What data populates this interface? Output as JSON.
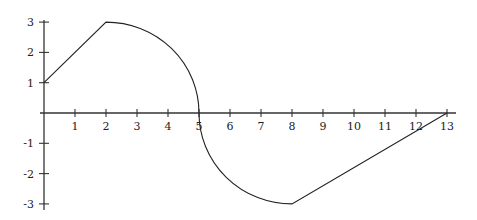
{
  "chart_data": {
    "type": "line",
    "title": "",
    "xlabel": "",
    "ylabel": "",
    "xlim": [
      0,
      13
    ],
    "ylim": [
      -3,
      3
    ],
    "grid": false,
    "legend": null,
    "x_ticks": [
      "1",
      "2",
      "3",
      "4",
      "5",
      "6",
      "7",
      "8",
      "9",
      "10",
      "11",
      "12",
      "13"
    ],
    "y_ticks": [
      "3",
      "2",
      "1",
      "-1",
      "-2",
      "-3"
    ],
    "segments": [
      {
        "kind": "line",
        "from": [
          0,
          1
        ],
        "to": [
          2,
          3
        ]
      },
      {
        "kind": "quarter-circle",
        "center": [
          2,
          0
        ],
        "radius": 3,
        "from": [
          2,
          3
        ],
        "to": [
          5,
          0
        ]
      },
      {
        "kind": "quarter-circle",
        "center": [
          8,
          0
        ],
        "radius": 3,
        "from": [
          5,
          0
        ],
        "to": [
          8,
          -3
        ]
      },
      {
        "kind": "line",
        "from": [
          8,
          -3
        ],
        "to": [
          13,
          0
        ]
      }
    ],
    "x": [
      0,
      2,
      3,
      4,
      5,
      6,
      7,
      8,
      13
    ],
    "y": [
      1,
      3,
      2.83,
      2.24,
      0,
      -2.24,
      -2.83,
      -3,
      0
    ]
  }
}
